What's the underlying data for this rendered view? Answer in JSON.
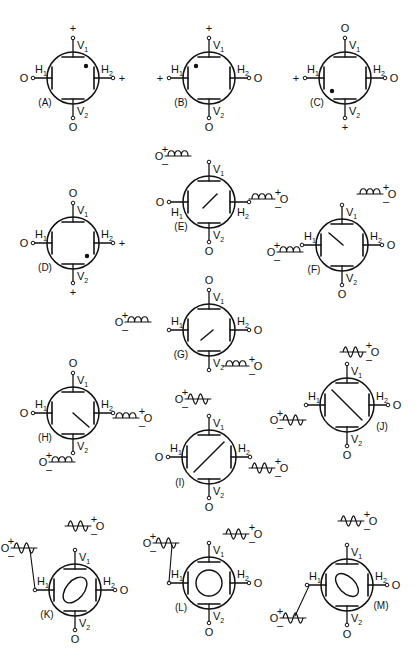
{
  "figure": {
    "width": 419,
    "height": 658,
    "ink_color": "#111111",
    "background": "#ffffff"
  },
  "terminal_labels": {
    "v1": "V",
    "v2": "V",
    "h1": "H",
    "h2": "H",
    "sub1": "1",
    "sub2": "2"
  },
  "diagrams": [
    {
      "id": "A",
      "caption": "(A)",
      "cx": 73,
      "cy": 78,
      "r": 26,
      "v1": "+",
      "v2": "O",
      "h1": "O",
      "h2": "+",
      "spot": {
        "dx": 13,
        "dy": -12
      },
      "trace": null,
      "caption_pos": "bl",
      "sources": []
    },
    {
      "id": "B",
      "caption": "(B)",
      "cx": 209,
      "cy": 78,
      "r": 26,
      "v1": "+",
      "v2": "O",
      "h1": "+",
      "h2": "O",
      "spot": {
        "dx": -13,
        "dy": -12
      },
      "trace": null,
      "caption_pos": "bl",
      "sources": []
    },
    {
      "id": "C",
      "caption": "(C)",
      "cx": 345,
      "cy": 78,
      "r": 26,
      "v1": "O",
      "v2": "+",
      "h1": "+",
      "h2": "O",
      "spot": {
        "dx": -13,
        "dy": 13
      },
      "trace": null,
      "caption_pos": "bl",
      "sources": []
    },
    {
      "id": "D",
      "caption": "(D)",
      "cx": 73,
      "cy": 243,
      "r": 26,
      "v1": "O",
      "v2": "+",
      "h1": "O",
      "h2": "+",
      "spot": {
        "dx": 14,
        "dy": 13
      },
      "trace": null,
      "caption_pos": "bl",
      "sources": []
    },
    {
      "id": "E",
      "caption": "(E)",
      "cx": 209,
      "cy": 202,
      "r": 26,
      "v1": "",
      "v2": "O",
      "h1": "O",
      "h2": "",
      "spot": null,
      "trace": {
        "type": "line",
        "x1": -6,
        "y1": 6,
        "x2": 8,
        "y2": -8
      },
      "caption_pos": "bl",
      "h_sub_below": true,
      "sources": [
        {
          "kind": "dc",
          "at": "v1",
          "x": 160,
          "y": 156,
          "plus": "+",
          "minus": "–",
          "term": "O"
        },
        {
          "kind": "dc",
          "at": "h2",
          "x": 244,
          "y": 199,
          "plus": "+",
          "minus": "–",
          "term": "O",
          "right": true
        }
      ]
    },
    {
      "id": "F",
      "caption": "(F)",
      "cx": 342,
      "cy": 245,
      "r": 26,
      "v1": "",
      "v2": "O",
      "h1": "",
      "h2": "O",
      "spot": null,
      "trace": {
        "type": "line",
        "x1": -13,
        "y1": -12,
        "x2": 1,
        "y2": 0
      },
      "caption_pos": "bl",
      "sources": [
        {
          "kind": "dc",
          "at": "v1",
          "x": 352,
          "y": 194,
          "plus": "+",
          "minus": "–",
          "term": "O",
          "right": true
        },
        {
          "kind": "dc",
          "at": "h1",
          "x": 272,
          "y": 252,
          "plus": "+",
          "minus": "–",
          "term": "O"
        }
      ]
    },
    {
      "id": "G",
      "caption": "(G)",
      "cx": 209,
      "cy": 330,
      "r": 26,
      "v1": "O",
      "v2": "",
      "h1": "",
      "h2": "O",
      "spot": null,
      "trace": {
        "type": "line",
        "x1": -8,
        "y1": 10,
        "x2": 4,
        "y2": 0
      },
      "caption_pos": "bl",
      "sources": [
        {
          "kind": "dc",
          "at": "h1",
          "x": 120,
          "y": 322,
          "plus": "+",
          "minus": "–",
          "term": "O"
        },
        {
          "kind": "dc",
          "at": "v2",
          "x": 218,
          "y": 366,
          "plus": "+",
          "minus": "–",
          "term": "O",
          "right": true
        }
      ]
    },
    {
      "id": "H",
      "caption": "(H)",
      "cx": 73,
      "cy": 413,
      "r": 26,
      "v1": "O",
      "v2": "",
      "h1": "O",
      "h2": "",
      "spot": null,
      "trace": {
        "type": "line",
        "x1": 0,
        "y1": 0,
        "x2": 16,
        "y2": 14
      },
      "caption_pos": "bl",
      "sources": [
        {
          "kind": "dc",
          "at": "h2",
          "x": 108,
          "y": 418,
          "plus": "+",
          "minus": "–",
          "term": "O",
          "right": true
        },
        {
          "kind": "dc",
          "at": "v2",
          "x": 44,
          "y": 462,
          "plus": "+",
          "minus": "–",
          "term": "O"
        }
      ]
    },
    {
      "id": "I",
      "caption": "(I)",
      "cx": 209,
      "cy": 457,
      "r": 27,
      "v1": "",
      "v2": "O",
      "h1": "O",
      "h2": "",
      "spot": null,
      "trace": {
        "type": "line",
        "x1": -15,
        "y1": 15,
        "x2": 15,
        "y2": -15
      },
      "caption_pos": "bl",
      "sources": [
        {
          "kind": "ac",
          "at": "v1",
          "x": 180,
          "y": 399,
          "plus": "+",
          "minus": "–",
          "term": "O"
        },
        {
          "kind": "ac",
          "at": "h2",
          "x": 244,
          "y": 468,
          "plus": "+",
          "minus": "–",
          "term": "O",
          "right": true
        }
      ]
    },
    {
      "id": "J",
      "caption": "(J)",
      "cx": 347,
      "cy": 405,
      "r": 27,
      "v1": "",
      "v2": "O",
      "h1": "",
      "h2": "O",
      "spot": null,
      "trace": {
        "type": "line",
        "x1": -15,
        "y1": -15,
        "x2": 15,
        "y2": 15
      },
      "caption_pos": "br",
      "sources": [
        {
          "kind": "ac",
          "at": "v1",
          "x": 335,
          "y": 352,
          "plus": "+",
          "minus": "–",
          "term": "O",
          "right": true
        },
        {
          "kind": "ac",
          "at": "h1",
          "x": 275,
          "y": 420,
          "plus": "+",
          "minus": "–",
          "term": "O"
        }
      ]
    },
    {
      "id": "K",
      "caption": "(K)",
      "cx": 75,
      "cy": 590,
      "r": 26,
      "v1": "",
      "v2": "O",
      "h1": "",
      "h2": "O",
      "spot": null,
      "trace": {
        "type": "ellipse",
        "rx": 15,
        "ry": 9,
        "rot": -50
      },
      "caption_pos": "bl",
      "sources": [
        {
          "kind": "ac",
          "at": "v1",
          "x": 60,
          "y": 526,
          "plus": "+",
          "minus": "–",
          "term": "O",
          "right": true,
          "detached": true
        },
        {
          "kind": "ac",
          "at": "h1",
          "x": 6,
          "y": 548,
          "plus": "+",
          "minus": "–",
          "term": "O",
          "lead": true
        }
      ]
    },
    {
      "id": "L",
      "caption": "(L)",
      "cx": 209,
      "cy": 583,
      "r": 26,
      "v1": "",
      "v2": "O",
      "h1": "",
      "h2": "O",
      "spot": null,
      "trace": {
        "type": "circle",
        "r": 13
      },
      "caption_pos": "bl",
      "sources": [
        {
          "kind": "ac",
          "at": "v1",
          "x": 218,
          "y": 534,
          "plus": "+",
          "minus": "–",
          "term": "O",
          "right": true
        },
        {
          "kind": "ac",
          "at": "h1",
          "x": 148,
          "y": 543,
          "plus": "+",
          "minus": "–",
          "term": "O",
          "lead": true
        }
      ]
    },
    {
      "id": "M",
      "caption": "(M)",
      "cx": 347,
      "cy": 585,
      "r": 26,
      "v1": "",
      "v2": "O",
      "h1": "",
      "h2": "O",
      "spot": null,
      "trace": {
        "type": "ellipse",
        "rx": 14,
        "ry": 8,
        "rot": 45
      },
      "caption_pos": "br",
      "sources": [
        {
          "kind": "ac",
          "at": "v1",
          "x": 333,
          "y": 521,
          "plus": "+",
          "minus": "–",
          "term": "O",
          "right": true
        },
        {
          "kind": "ac",
          "at": "h1",
          "x": 275,
          "y": 618,
          "plus": "+",
          "minus": "–",
          "term": "O",
          "leadUp": true
        }
      ]
    }
  ]
}
